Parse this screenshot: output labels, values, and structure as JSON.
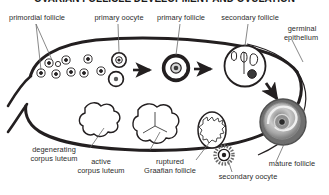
{
  "figure": {
    "title": "OVARIAN FOLLICLE DEVELOPMENT AND OVULATION",
    "title_clipped": true,
    "background_color": "#ffffff",
    "ink_color": "#231f20",
    "label_color": "#2b2b2b"
  },
  "labels": {
    "primordial_follicle": "primordial follicle",
    "primary_oocyte": "primary oocyte",
    "primary_follicle": "primary follicle",
    "secondary_follicle": "secondary follicle",
    "germinal_epithelium_line1": "germinal",
    "germinal_epithelium_line2": "epithelium",
    "degenerating_corpus_luteum_line1": "degenerating",
    "degenerating_corpus_luteum_line2": "corpus luteum",
    "active_corpus_luteum_line1": "active",
    "active_corpus_luteum_line2": "corpus luteum",
    "ruptured_graafian_follicle_line1": "ruptured",
    "ruptured_graafian_follicle_line2": "Graafian follicle",
    "secondary_oocyte": "secondary oocyte",
    "mature_follicle": "mature follicle"
  },
  "structures": [
    {
      "name": "ovary-outline",
      "description": "thick dark oval cortex band enclosing the field"
    },
    {
      "name": "germinal-epithelium",
      "description": "thin outer line along the right border of the ovary"
    },
    {
      "name": "primordial-follicle-cluster",
      "description": "cluster of small circles with central dots at upper left",
      "count": 9
    },
    {
      "name": "primary-oocyte",
      "description": "small circle with ring and central nucleus"
    },
    {
      "name": "primary-follicle",
      "description": "thick dark ring with pale cytoplasm and central nucleus"
    },
    {
      "name": "secondary-follicle",
      "description": "larger ring with antral spaces and eccentric dark oocyte"
    },
    {
      "name": "mature-follicle",
      "description": "large grey concentric Graafian follicle at lower right"
    },
    {
      "name": "secondary-oocyte",
      "description": "small radiating circle with corona radiata released at ovulation"
    },
    {
      "name": "ruptured-graafian-follicle",
      "description": "collapsed follicle with jagged inner outline"
    },
    {
      "name": "active-corpus-luteum",
      "description": "lobed scalloped body with internal radiating lines"
    },
    {
      "name": "degenerating-corpus-luteum",
      "description": "smaller lobed scalloped body, corpus albicans"
    },
    {
      "name": "maturation-arrow-1",
      "description": "rightward arrow from primary oocyte to primary follicle"
    },
    {
      "name": "maturation-arrow-2",
      "description": "rightward arrow from primary follicle to secondary follicle"
    },
    {
      "name": "ovulation-arrow",
      "description": "downward-right arrow toward mature follicle"
    }
  ]
}
